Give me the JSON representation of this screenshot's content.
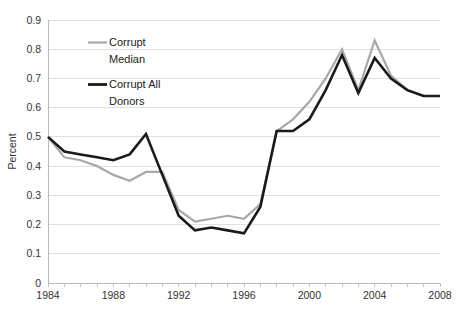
{
  "chart_data": {
    "type": "line",
    "title": "",
    "xlabel": "",
    "ylabel": "Percent",
    "xlim": [
      1984,
      2008
    ],
    "ylim": [
      0,
      0.9
    ],
    "grid": true,
    "legend_position": "upper-left-inside",
    "x": [
      1984,
      1985,
      1986,
      1987,
      1988,
      1989,
      1990,
      1991,
      1992,
      1993,
      1994,
      1995,
      1996,
      1997,
      1998,
      1999,
      2000,
      2001,
      2002,
      2003,
      2004,
      2005,
      2006,
      2007,
      2008
    ],
    "x_tick_labels": [
      "1984",
      "1988",
      "1992",
      "1996",
      "2000",
      "2004",
      "2008"
    ],
    "x_tick_values": [
      1984,
      1988,
      1992,
      1996,
      2000,
      2004,
      2008
    ],
    "y_tick_labels": [
      "0",
      "0.1",
      "0.2",
      "0.3",
      "0.4",
      "0.5",
      "0.6",
      "0.7",
      "0.8",
      "0.9"
    ],
    "y_tick_values": [
      0,
      0.1,
      0.2,
      0.3,
      0.4,
      0.5,
      0.6,
      0.7,
      0.8,
      0.9
    ],
    "series": [
      {
        "name": "Corrupt Median",
        "color": "#a8a8a8",
        "width": 2.2,
        "values": [
          0.5,
          0.43,
          0.42,
          0.4,
          0.37,
          0.35,
          0.38,
          0.38,
          0.25,
          0.21,
          0.22,
          0.23,
          0.22,
          0.27,
          0.52,
          0.56,
          0.62,
          0.7,
          0.8,
          0.66,
          0.83,
          0.71,
          0.66,
          0.64,
          0.64
        ]
      },
      {
        "name": "Corrupt All Donors",
        "color": "#1a1a1a",
        "width": 2.6,
        "values": [
          0.5,
          0.45,
          0.44,
          0.43,
          0.42,
          0.44,
          0.51,
          0.37,
          0.23,
          0.18,
          0.19,
          0.18,
          0.17,
          0.26,
          0.52,
          0.52,
          0.56,
          0.66,
          0.78,
          0.65,
          0.77,
          0.7,
          0.66,
          0.64,
          0.64
        ]
      }
    ]
  },
  "legend": {
    "items": [
      {
        "label_line1": "Corrupt",
        "label_line2": "Median",
        "color": "#a8a8a8"
      },
      {
        "label_line1": "Corrupt All",
        "label_line2": "Donors",
        "color": "#1a1a1a"
      }
    ]
  },
  "axes": {
    "y_title": "Percent"
  }
}
